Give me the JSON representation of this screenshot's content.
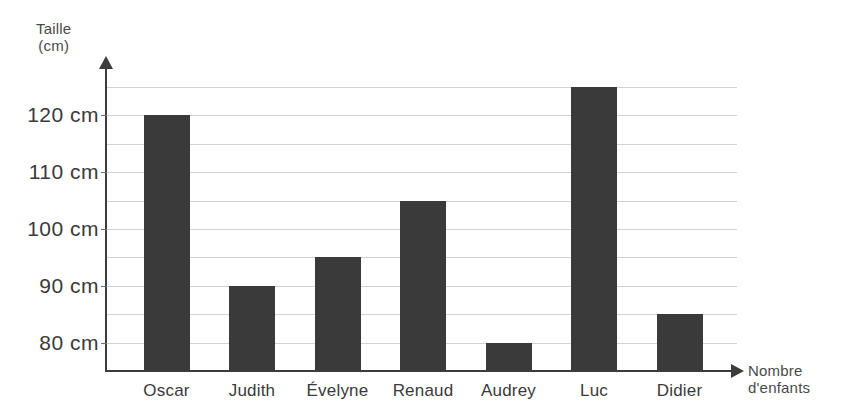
{
  "chart_data": {
    "type": "bar",
    "title": "",
    "xlabel": "Nombre d'enfants",
    "ylabel": "Taille (cm)",
    "ylabel_lines": [
      "Taille",
      "(cm)"
    ],
    "xlabel_lines": [
      "Nombre",
      "d'enfants"
    ],
    "categories": [
      "Oscar",
      "Judith",
      "Évelyne",
      "Renaud",
      "Audrey",
      "Luc",
      "Didier"
    ],
    "values": [
      120,
      90,
      95,
      105,
      80,
      125,
      85
    ],
    "unit": "cm",
    "ylim": [
      75,
      127.5
    ],
    "y_tick_labels": [
      "120 cm",
      "110 cm",
      "100 cm",
      "90 cm",
      "80 cm"
    ],
    "y_tick_values": [
      120,
      110,
      100,
      90,
      80
    ],
    "gridline_values": [
      125,
      120,
      115,
      110,
      105,
      100,
      95,
      90,
      85,
      80
    ],
    "grid": true,
    "legend": "none",
    "bar_color": "#3a3a3a",
    "grid_color": "#d2d2d2",
    "axis_color": "#3c3c3c",
    "text_color": "#3a3a3a"
  },
  "axes": {
    "y_arrow": "up-arrow-icon",
    "x_arrow": "right-arrow-icon"
  }
}
